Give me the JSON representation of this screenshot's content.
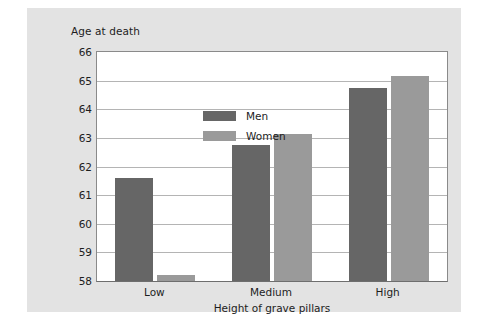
{
  "chart_data": {
    "type": "bar",
    "title": "",
    "xlabel": "Height of grave pillars",
    "ylabel": "Age at death",
    "categories": [
      "Low",
      "Medium",
      "High"
    ],
    "series": [
      {
        "name": "Men",
        "color": "#666666",
        "values": [
          61.6,
          62.75,
          64.75
        ]
      },
      {
        "name": "Women",
        "color": "#9a9a9a",
        "values": [
          58.2,
          63.15,
          65.15
        ]
      }
    ],
    "ylim": [
      58,
      66
    ],
    "yticks": [
      58,
      59,
      60,
      61,
      62,
      63,
      64,
      65,
      66
    ],
    "ytick_labels": [
      "58",
      "59",
      "60",
      "61",
      "62",
      "63",
      "64",
      "65",
      "66"
    ],
    "grid": true,
    "grid_axis": "y",
    "legend_position": "upper-left-inside"
  },
  "colors": {
    "panel_background": "#e3e3e3",
    "plot_background": "#ffffff",
    "gridline": "#b4b4b4",
    "axis": "#8a8a8a",
    "text": "#1d1d1d",
    "men_bar": "#666666",
    "women_bar": "#9a9a9a"
  }
}
